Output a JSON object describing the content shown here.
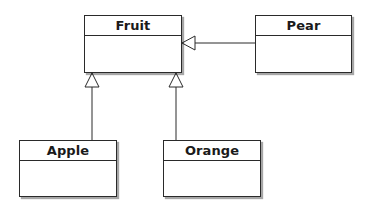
{
  "diagram": {
    "type": "uml-class-diagram",
    "classes": [
      {
        "id": "fruit",
        "name": "Fruit"
      },
      {
        "id": "pear",
        "name": "Pear"
      },
      {
        "id": "apple",
        "name": "Apple"
      },
      {
        "id": "orange",
        "name": "Orange"
      }
    ],
    "relationships": [
      {
        "type": "generalization",
        "from": "Pear",
        "to": "Fruit"
      },
      {
        "type": "generalization",
        "from": "Apple",
        "to": "Fruit"
      },
      {
        "type": "generalization",
        "from": "Orange",
        "to": "Fruit"
      }
    ],
    "colors": {
      "line": "#2a2a2a",
      "background": "#ffffff"
    }
  }
}
